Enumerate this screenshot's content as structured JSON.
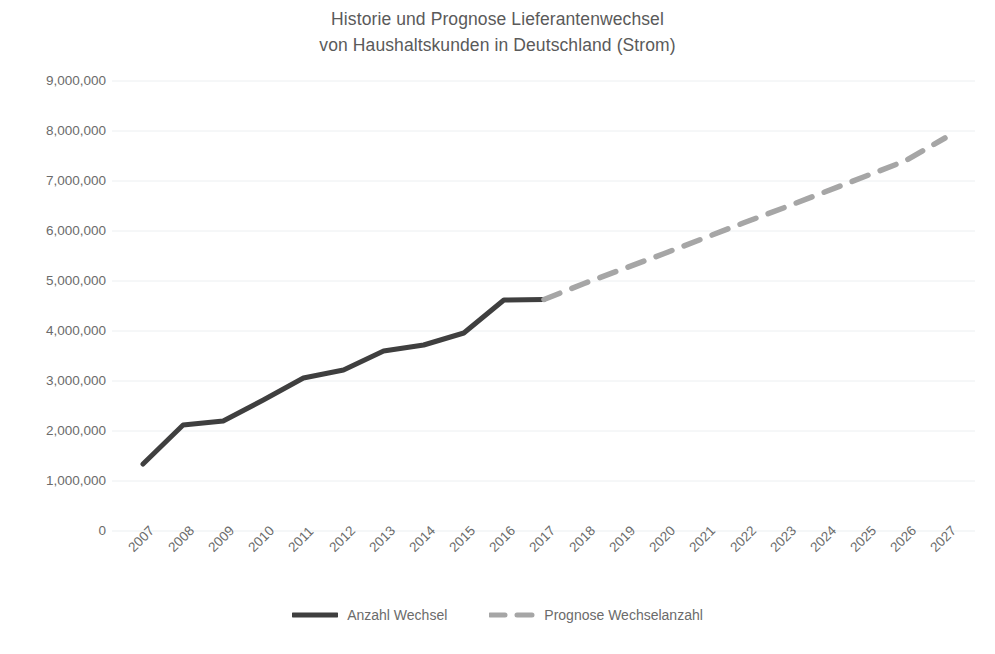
{
  "chart_data": {
    "type": "line",
    "title": "Historie und Prognose Lieferantenwechsel von Haushaltskunden in Deutschland (Strom)",
    "title_lines": [
      "Historie und Prognose Lieferantenwechsel",
      "von Haushaltskunden in Deutschland (Strom)"
    ],
    "xlabel": "",
    "ylabel": "",
    "x": [
      "2007",
      "2008",
      "2009",
      "2010",
      "2011",
      "2012",
      "2013",
      "2014",
      "2015",
      "2016",
      "2017",
      "2018",
      "2019",
      "2020",
      "2021",
      "2022",
      "2023",
      "2024",
      "2025",
      "2026",
      "2027"
    ],
    "categories": [
      "2007",
      "2008",
      "2009",
      "2010",
      "2011",
      "2012",
      "2013",
      "2014",
      "2015",
      "2016",
      "2017",
      "2018",
      "2019",
      "2020",
      "2021",
      "2022",
      "2023",
      "2024",
      "2025",
      "2026",
      "2027"
    ],
    "ylim": [
      0,
      9000000
    ],
    "ytick_values": [
      0,
      1000000,
      2000000,
      3000000,
      4000000,
      5000000,
      6000000,
      7000000,
      8000000,
      9000000
    ],
    "ytick_labels": [
      "0",
      "1,000,000",
      "2,000,000",
      "3,000,000",
      "4,000,000",
      "5,000,000",
      "6,000,000",
      "7,000,000",
      "8,000,000",
      "9,000,000"
    ],
    "grid": true,
    "grid_axis": "y",
    "legend_position": "bottom",
    "series": [
      {
        "name": "Anzahl Wechsel",
        "style": "solid",
        "color": "#3f3f3f",
        "values": [
          1340000,
          2120000,
          2200000,
          2620000,
          3060000,
          3220000,
          3600000,
          3720000,
          3960000,
          4620000,
          4630000,
          null,
          null,
          null,
          null,
          null,
          null,
          null,
          null,
          null,
          null
        ]
      },
      {
        "name": "Prognose Wechselanzahl",
        "style": "dashed",
        "color": "#a6a6a6",
        "values": [
          null,
          null,
          null,
          null,
          null,
          null,
          null,
          null,
          null,
          null,
          4630000,
          4950000,
          5250000,
          5550000,
          5860000,
          6170000,
          6470000,
          6780000,
          7090000,
          7400000,
          7860000
        ]
      }
    ]
  },
  "colors": {
    "history_line": "#3f3f3f",
    "forecast_line": "#a6a6a6",
    "text": "#6b6b6b",
    "gridline": "#eceff1",
    "background": "#ffffff"
  },
  "legend": {
    "items": [
      {
        "label": "Anzahl Wechsel",
        "style": "solid",
        "color": "#3f3f3f"
      },
      {
        "label": "Prognose Wechselanzahl",
        "style": "dashed",
        "color": "#a6a6a6"
      }
    ]
  }
}
